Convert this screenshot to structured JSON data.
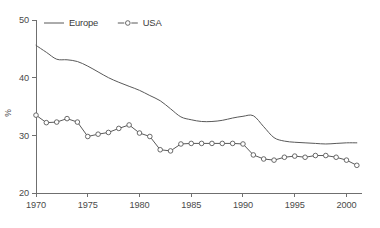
{
  "figure": {
    "background": "#ffffff",
    "axis_color": "#6f6f6f",
    "text_color": "#3b3b3b"
  },
  "legend": {
    "position": "top-left-inside",
    "entries": [
      {
        "label": "Europe",
        "color": "#595959",
        "marker": "none",
        "style": "solid"
      },
      {
        "label": "USA",
        "color": "#595959",
        "marker": "open-circle",
        "style": "solid"
      }
    ]
  },
  "axes": {
    "y": {
      "label": "%",
      "ticks": [
        "20",
        "30",
        "40",
        "50"
      ],
      "min": 20,
      "max": 50
    },
    "x": {
      "label": "",
      "ticks": [
        "1970",
        "1975",
        "1980",
        "1985",
        "1990",
        "1995",
        "2000"
      ],
      "min": 1970,
      "max": 2001.5
    }
  },
  "chart_data": {
    "type": "line",
    "title": "",
    "xlabel": "",
    "ylabel": "%",
    "xlim": [
      1970,
      2001.5
    ],
    "ylim": [
      20,
      50
    ],
    "grid": false,
    "legend_position": "upper left",
    "x": [
      1970,
      1971,
      1972,
      1973,
      1974,
      1975,
      1976,
      1977,
      1978,
      1979,
      1980,
      1981,
      1982,
      1983,
      1984,
      1985,
      1986,
      1987,
      1988,
      1989,
      1990,
      1991,
      1992,
      1993,
      1994,
      1995,
      1996,
      1997,
      1998,
      1999,
      2000,
      2001
    ],
    "series": [
      {
        "name": "Europe",
        "color": "#595959",
        "marker": "none",
        "values": [
          45.6,
          44.4,
          43.2,
          43.1,
          42.8,
          42.0,
          41.0,
          40.0,
          39.2,
          38.5,
          37.8,
          36.9,
          36.0,
          34.6,
          33.2,
          32.7,
          32.4,
          32.4,
          32.6,
          33.0,
          33.3,
          33.4,
          31.5,
          29.6,
          29.0,
          28.8,
          28.7,
          28.6,
          28.5,
          28.6,
          28.7,
          28.7
        ]
      },
      {
        "name": "USA",
        "color": "#595959",
        "marker": "open-circle",
        "values": [
          33.5,
          32.2,
          32.3,
          32.9,
          32.3,
          29.8,
          30.2,
          30.5,
          31.2,
          31.8,
          30.4,
          29.8,
          27.5,
          27.3,
          28.5,
          28.6,
          28.6,
          28.6,
          28.6,
          28.6,
          28.5,
          26.6,
          25.9,
          25.7,
          26.2,
          26.4,
          26.2,
          26.5,
          26.5,
          26.2,
          25.7,
          24.8
        ]
      }
    ]
  },
  "caption": {
    "text": ""
  }
}
